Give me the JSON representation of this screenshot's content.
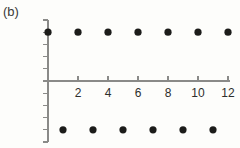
{
  "figure": {
    "panel_label": "(b)",
    "background_color": "#fdfdfb",
    "axis_color": "#8a8a88",
    "marker_color": "#1c1c1a",
    "text_color": "#2e2e2c"
  },
  "chart_data": {
    "type": "scatter",
    "title": "",
    "xlabel": "",
    "ylabel": "",
    "xlim": [
      -0.6,
      12.6
    ],
    "ylim": [
      -2.5,
      2.5
    ],
    "grid": false,
    "legend": null,
    "x_ticks": [
      2,
      4,
      6,
      8,
      10,
      12
    ],
    "x_tick_labels": [
      "2",
      "4",
      "6",
      "8",
      "10",
      "12"
    ],
    "y_ticks": [
      2.5,
      2.0,
      1.5,
      1.0,
      0.5,
      0,
      -0.5,
      -1.0,
      -1.5,
      -2.0,
      -2.5
    ],
    "y_tick_labels": [
      "2·5",
      "2·0",
      "1·5",
      "1·0",
      "0·5",
      "0",
      "−0·5",
      "−1·0",
      "−1·5",
      "−2·0",
      "−2·5"
    ],
    "series": [
      {
        "name": "upper",
        "x": [
          0,
          2,
          4,
          6,
          8,
          10,
          12
        ],
        "y": [
          2,
          2,
          2,
          2,
          2,
          2,
          2
        ]
      },
      {
        "name": "lower",
        "x": [
          1,
          3,
          5,
          7,
          9,
          11
        ],
        "y": [
          -2,
          -2,
          -2,
          -2,
          -2,
          -2
        ]
      }
    ]
  }
}
